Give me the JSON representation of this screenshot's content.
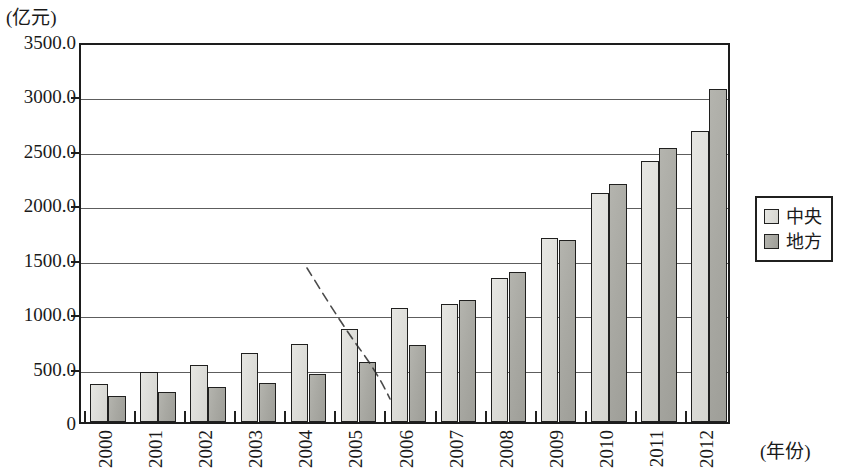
{
  "chart_data": {
    "type": "bar",
    "title": "",
    "unit_label": "(亿元)",
    "xlabel": "(年份)",
    "ylabel": "",
    "categories": [
      "2000",
      "2001",
      "2002",
      "2003",
      "2004",
      "2005",
      "2006",
      "2007",
      "2008",
      "2009",
      "2010",
      "2011",
      "2012"
    ],
    "series": [
      {
        "name": "中央",
        "color": "#dedeb9",
        "values": [
          350,
          460,
          525,
          635,
          720,
          850,
          1045,
          1080,
          1320,
          1690,
          2105,
          2400,
          2670
        ]
      },
      {
        "name": "地方",
        "color": "#a9a9a3",
        "values": [
          240,
          280,
          325,
          355,
          440,
          555,
          705,
          1120,
          1380,
          1670,
          2190,
          2520,
          3055
        ]
      }
    ],
    "ylim": [
      0,
      3500
    ],
    "ytick_values": [
      0,
      500,
      1000,
      1500,
      2000,
      2500,
      3000,
      3500
    ],
    "ytick_labels": [
      "0",
      "500.0",
      "1000.0",
      "1500.0",
      "2000.0",
      "2500.0",
      "3000.0",
      "3500.0"
    ],
    "grid": true,
    "grid_axis": "y",
    "legend_position": "right",
    "annotations": [
      {
        "name": "hand-drawn-dashed-trend-line",
        "style": "dashed",
        "from_year": "2005",
        "to_year": "2006"
      }
    ]
  },
  "legend": {
    "entries": [
      {
        "label": "中央",
        "swatch": "central"
      },
      {
        "label": "地方",
        "swatch": "local"
      }
    ]
  }
}
